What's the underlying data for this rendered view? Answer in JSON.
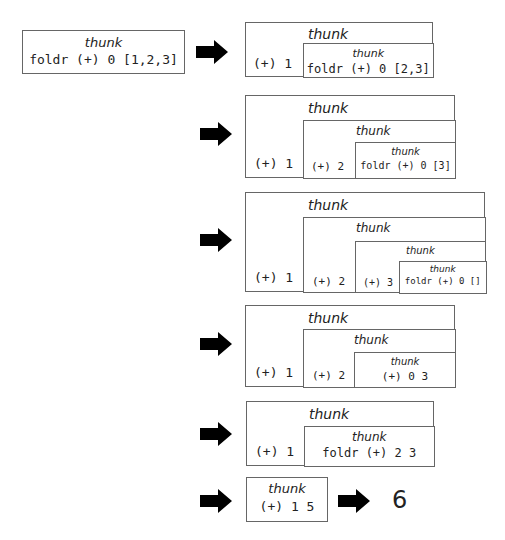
{
  "diagram": {
    "thunk_label": "thunk",
    "steps": [
      {
        "expr": "foldr (+) 0 [1,2,3]"
      },
      {
        "outer": "(+) 1",
        "inner": "foldr (+) 0 [2,3]"
      },
      {
        "outer": "(+) 1",
        "mid": "(+) 2",
        "inner": "foldr (+) 0 [3]"
      },
      {
        "outer": "(+) 1",
        "mid": "(+) 2",
        "mid2": "(+) 3",
        "inner": "foldr (+) 0 []"
      },
      {
        "outer": "(+) 1",
        "mid": "(+) 2",
        "inner": "(+) 0 3"
      },
      {
        "outer": "(+) 1",
        "inner": "foldr (+) 2 3"
      },
      {
        "expr": "(+) 1 5"
      }
    ],
    "result": "6",
    "arrow_icon": "right-arrow-icon"
  }
}
